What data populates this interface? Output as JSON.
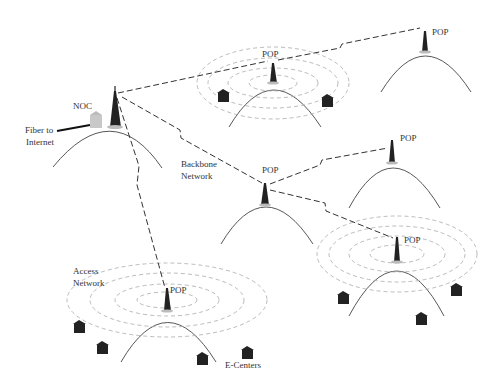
{
  "diagram": {
    "labels": {
      "noc": "NOC",
      "fiber_line1": "Fiber to",
      "fiber_line2": "Internet",
      "backbone_line1": "Backbone",
      "backbone_line2": "Network",
      "access_line1": "Access",
      "access_line2": "Network",
      "ecenters": "E-Centers",
      "pop": "POP"
    },
    "nodes": [
      {
        "id": "noc",
        "label": "NOC",
        "x": 112,
        "y": 125
      },
      {
        "id": "pop-top-center",
        "label": "POP",
        "x": 273,
        "y": 83
      },
      {
        "id": "pop-top-right",
        "label": "POP",
        "x": 425,
        "y": 48
      },
      {
        "id": "pop-mid-center",
        "label": "POP",
        "x": 265,
        "y": 200
      },
      {
        "id": "pop-mid-right",
        "label": "POP",
        "x": 392,
        "y": 157
      },
      {
        "id": "pop-bottom-right",
        "label": "POP",
        "x": 397,
        "y": 254
      },
      {
        "id": "pop-bottom-left",
        "label": "POP",
        "x": 167,
        "y": 310
      }
    ],
    "colors": {
      "line": "#333333",
      "ring": "#aaaaaa",
      "house": "#222222",
      "noc_building": "#c8c8c8"
    }
  }
}
